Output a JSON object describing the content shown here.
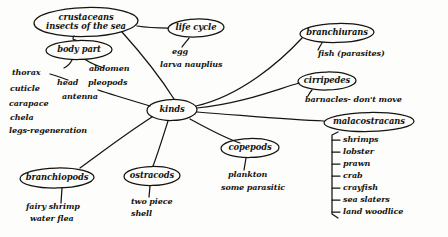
{
  "document": {
    "type": "hand-drawn concept map",
    "title": "crustaceans insects of the sea",
    "ink_color": "#15140f",
    "paper_color": "#fdfdfb"
  },
  "nodes": {
    "root": {
      "label": "crustaceans\ninsects of the sea",
      "line1": "crustaceans",
      "line2": "insects of the sea"
    },
    "center": {
      "label": "kinds"
    },
    "body_part": {
      "label": "body part"
    },
    "life_cycle": {
      "label": "life cycle"
    },
    "branchiurans": {
      "label": "branchiurans"
    },
    "cirripedes": {
      "label": "cirripedes"
    },
    "malacostracans": {
      "label": "malacostracans"
    },
    "copepods": {
      "label": "copepods"
    },
    "ostracods": {
      "label": "ostracods"
    },
    "branchiopods": {
      "label": "branchiopods"
    }
  },
  "leaves": {
    "body_part_left": [
      "thorax",
      "cuticle",
      "carapace",
      "chela",
      "legs-regeneration"
    ],
    "body_part_mid": [
      "head",
      "antenna"
    ],
    "body_part_right": [
      "abdomen",
      "pleopods"
    ],
    "life_cycle": [
      "egg",
      "larva nauplius"
    ],
    "branchiurans": [
      "fish (parasites)"
    ],
    "cirripedes": [
      "barnacles- don't move"
    ],
    "malacostracans": [
      "shrimps",
      "lobster",
      "prawn",
      "crab",
      "crayfish",
      "sea slaters",
      "land woodlice"
    ],
    "copepods": [
      "plankton",
      "some parasitic"
    ],
    "ostracods": [
      "two piece",
      "shell"
    ],
    "branchiopods": [
      "fairy shrimp",
      "water flea"
    ]
  }
}
